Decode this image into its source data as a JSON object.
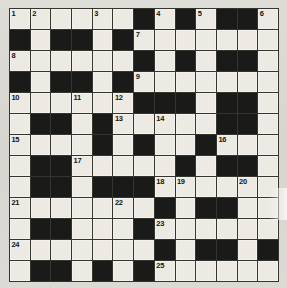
{
  "puzzle": {
    "type": "crossword-grid",
    "rows": 13,
    "columns": 13,
    "colors": {
      "white_cell": "#eceae3",
      "black_cell": "#1a1a18",
      "grid_line": "#35352f",
      "paper": "#d9d8d3",
      "number_text": "#16160f"
    },
    "legend": {
      "white": "open letter square",
      "black": "blocked square"
    },
    "cells": [
      [
        "w1",
        "w2",
        "w",
        "w",
        "w3",
        "w",
        "b",
        "w4",
        "b",
        "w5",
        "b",
        "b",
        "w6"
      ],
      [
        "b",
        "w",
        "b",
        "b",
        "w",
        "b",
        "w7",
        "w",
        "w",
        "w",
        "w",
        "w",
        "w"
      ],
      [
        "w8",
        "w",
        "w",
        "w",
        "w",
        "w",
        "b",
        "w",
        "b",
        "w",
        "b",
        "b",
        "w"
      ],
      [
        "b",
        "w",
        "b",
        "b",
        "w",
        "b",
        "w9",
        "w",
        "w",
        "w",
        "w",
        "w",
        "w"
      ],
      [
        "w10",
        "w",
        "w",
        "w11",
        "w",
        "w12",
        "b",
        "b",
        "b",
        "w",
        "b",
        "b",
        "w"
      ],
      [
        "w",
        "b",
        "b",
        "w",
        "b",
        "w13",
        "w",
        "w14",
        "w",
        "w",
        "b",
        "b",
        "w"
      ],
      [
        "w15",
        "w",
        "w",
        "w",
        "b",
        "w",
        "b",
        "w",
        "w",
        "b",
        "w16",
        "w",
        "w"
      ],
      [
        "w",
        "b",
        "b",
        "w17",
        "w",
        "w",
        "w",
        "w",
        "b",
        "w",
        "b",
        "b",
        "w"
      ],
      [
        "w",
        "b",
        "b",
        "w",
        "b",
        "b",
        "b",
        "w18",
        "w19",
        "w",
        "w",
        "w20",
        "w"
      ],
      [
        "w21",
        "w",
        "w",
        "w",
        "w",
        "w22",
        "w",
        "b",
        "w",
        "b",
        "b",
        "w",
        "w"
      ],
      [
        "w",
        "b",
        "b",
        "w",
        "w",
        "w",
        "b",
        "w23",
        "w",
        "w",
        "w",
        "w",
        "w"
      ],
      [
        "w24",
        "w",
        "w",
        "w",
        "w",
        "w",
        "w",
        "b",
        "w",
        "b",
        "b",
        "w",
        "b"
      ],
      [
        "w",
        "b",
        "b",
        "w",
        "b",
        "w",
        "b",
        "w25",
        "w",
        "w",
        "w",
        "w",
        "w"
      ]
    ],
    "numbers": {
      "1": {
        "row": 1,
        "col": 1
      },
      "2": {
        "row": 1,
        "col": 2
      },
      "3": {
        "row": 1,
        "col": 5
      },
      "4": {
        "row": 1,
        "col": 8
      },
      "5": {
        "row": 1,
        "col": 10
      },
      "6": {
        "row": 1,
        "col": 13
      },
      "7": {
        "row": 2,
        "col": 7
      },
      "8": {
        "row": 3,
        "col": 1
      },
      "9": {
        "row": 4,
        "col": 7
      },
      "10": {
        "row": 5,
        "col": 1
      },
      "11": {
        "row": 5,
        "col": 4
      },
      "12": {
        "row": 5,
        "col": 6
      },
      "13": {
        "row": 6,
        "col": 6
      },
      "14": {
        "row": 6,
        "col": 8
      },
      "15": {
        "row": 7,
        "col": 1
      },
      "16": {
        "row": 7,
        "col": 11
      },
      "17": {
        "row": 8,
        "col": 4
      },
      "18": {
        "row": 9,
        "col": 8
      },
      "19": {
        "row": 9,
        "col": 9
      },
      "20": {
        "row": 9,
        "col": 12
      },
      "21": {
        "row": 10,
        "col": 1
      },
      "22": {
        "row": 10,
        "col": 6
      },
      "23": {
        "row": 11,
        "col": 8
      },
      "24": {
        "row": 12,
        "col": 1
      },
      "25": {
        "row": 13,
        "col": 8
      }
    },
    "number_labels": [
      "1",
      "2",
      "3",
      "4",
      "5",
      "6",
      "7",
      "8",
      "9",
      "10",
      "11",
      "12",
      "13",
      "14",
      "15",
      "16",
      "17",
      "18",
      "19",
      "20",
      "21",
      "22",
      "23",
      "24",
      "25"
    ]
  }
}
